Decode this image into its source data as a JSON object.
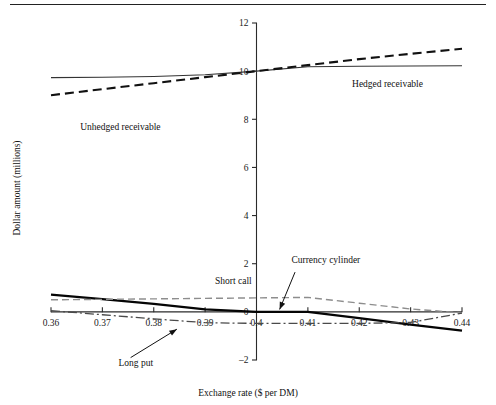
{
  "figure": {
    "rule_present": true,
    "background": "#ffffff"
  },
  "chart_data": {
    "type": "line",
    "title": "",
    "xlabel": "Exchange rate ($ per DM)",
    "ylabel": "Dollar amount (millions)",
    "xlim": [
      0.355,
      0.445
    ],
    "ylim": [
      -2,
      12
    ],
    "xticks": [
      0.36,
      0.37,
      0.38,
      0.39,
      0.4,
      0.41,
      0.42,
      0.43,
      0.44
    ],
    "xtick_labels": [
      "0.36",
      "0.37",
      "0.38",
      "0.39",
      "0.4",
      "0.41",
      "0.42",
      "0.43",
      "0.44"
    ],
    "yticks": [
      -2,
      0,
      2,
      4,
      6,
      8,
      10,
      12
    ],
    "ytick_labels": [
      "–2",
      "0",
      "2",
      "4",
      "6",
      "8",
      "10",
      "12"
    ],
    "grid": false,
    "legend_position": "inline-annotations",
    "x": [
      0.36,
      0.37,
      0.38,
      0.39,
      0.4,
      0.41,
      0.42,
      0.43,
      0.44
    ],
    "series": [
      {
        "name": "Hedged receivable",
        "style": "solid-thin",
        "color": "#333333",
        "values": [
          9.73,
          9.75,
          9.78,
          9.85,
          10.0,
          10.18,
          10.2,
          10.21,
          10.22
        ]
      },
      {
        "name": "Unhedged receivable",
        "style": "dashed-black",
        "color": "#111111",
        "values": [
          9.0,
          9.25,
          9.5,
          9.75,
          10.0,
          10.25,
          10.5,
          10.72,
          10.93
        ]
      },
      {
        "name": "Currency cylinder",
        "style": "solid-thick",
        "color": "#050505",
        "values": [
          0.72,
          0.53,
          0.33,
          0.1,
          0.0,
          0.0,
          -0.26,
          -0.53,
          -0.78
        ]
      },
      {
        "name": "Short call",
        "style": "dashed-gray",
        "color": "#8d8d8d",
        "values": [
          0.5,
          0.52,
          0.54,
          0.56,
          0.58,
          0.6,
          0.36,
          0.12,
          -0.04
        ]
      },
      {
        "name": "Long put",
        "style": "dashdot",
        "color": "#4a4a4a",
        "values": [
          0.05,
          -0.12,
          -0.29,
          -0.45,
          -0.48,
          -0.48,
          -0.48,
          -0.44,
          -0.05
        ]
      }
    ],
    "annotations": [
      {
        "name": "hedged-receivable-label",
        "text": "Hedged receivable",
        "x": 0.4255,
        "y": 9.35,
        "anchor": "middle",
        "leader": false
      },
      {
        "name": "unhedged-receivable-label",
        "text": "Unhedged receivable",
        "x": 0.3735,
        "y": 7.55,
        "anchor": "middle",
        "leader": false
      },
      {
        "name": "short-call-label",
        "text": "Short call",
        "x": 0.3955,
        "y": 1.15,
        "anchor": "middle",
        "leader": false
      },
      {
        "name": "currency-cylinder-label",
        "text": "Currency cylinder",
        "x": 0.4135,
        "y": 2.05,
        "anchor": "middle",
        "leader": true,
        "leader_from": [
          0.4075,
          1.65
        ],
        "leader_to": [
          0.4045,
          0.1
        ]
      },
      {
        "name": "long-put-label",
        "text": "Long put",
        "x": 0.3765,
        "y": -2.25,
        "anchor": "middle",
        "leader": true,
        "leader_from": [
          0.3755,
          -1.9
        ],
        "leader_to": [
          0.3845,
          -0.72
        ]
      }
    ]
  }
}
